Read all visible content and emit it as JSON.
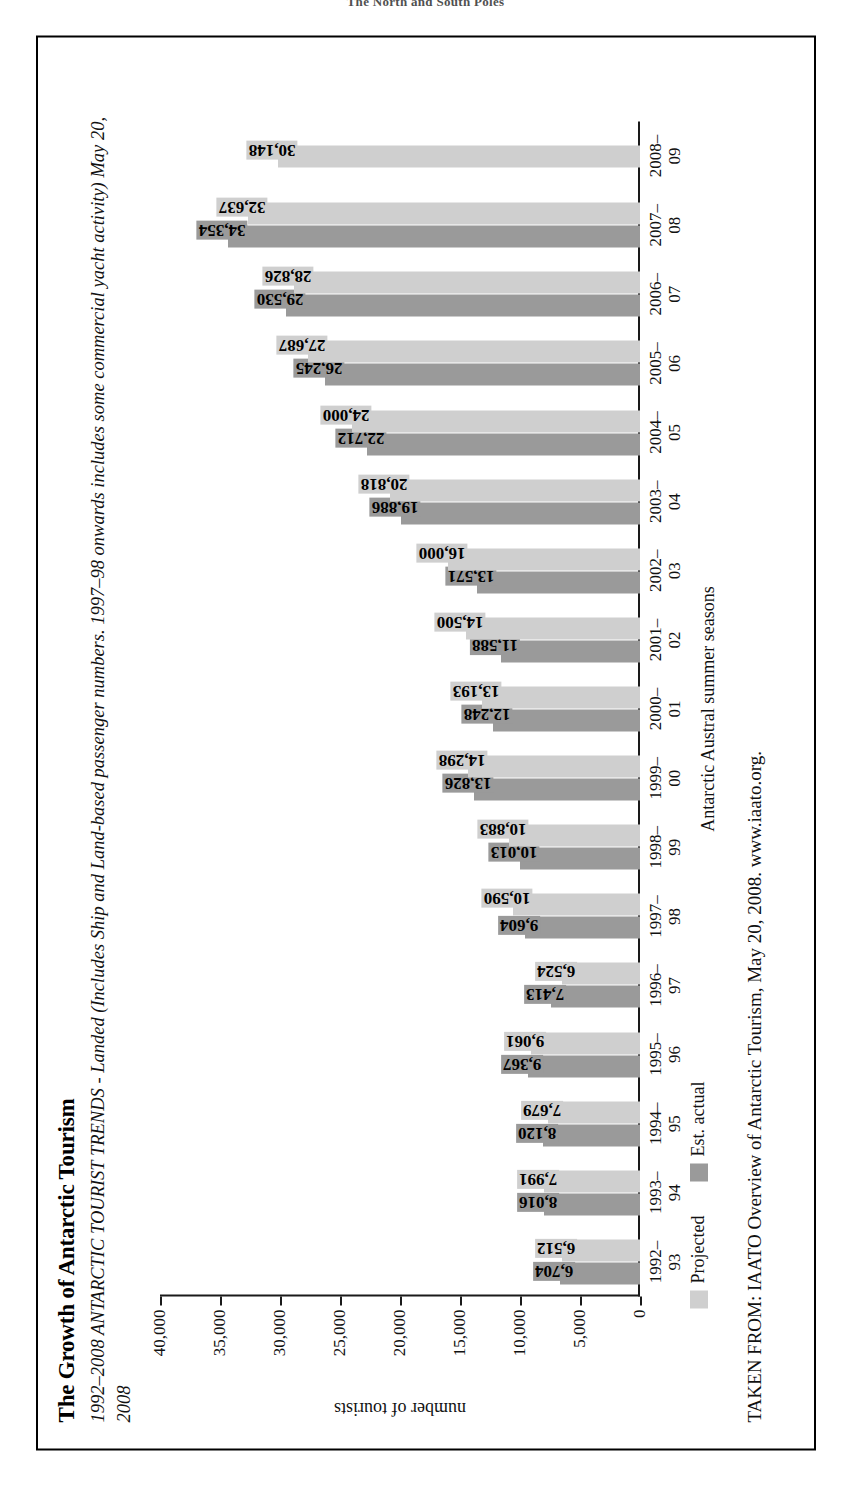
{
  "page_header": "The North and South Poles",
  "figure": {
    "title": "The Growth of Antarctic Tourism",
    "subtitle": "1992–2008 ANTARCTIC TOURIST TRENDS - Landed (Includes Ship and Land-based passenger numbers. 1997–98 onwards includes some commercial yacht activity) May 20, 2008",
    "source": "TAKEN FROM: IAATO Overview of Antarctic Tourism, May 20, 2008. www.iaato.org.",
    "legend": {
      "projected_label": "Projected",
      "actual_label": "Est. actual"
    },
    "colors": {
      "projected": "#cfcfcf",
      "actual": "#9a9a9a",
      "axis": "#1a1a1a",
      "border": "#000000"
    }
  },
  "chart_data": {
    "type": "bar",
    "title": "The Growth of Antarctic Tourism",
    "subtitle": "1992–2008 ANTARCTIC TOURIST TRENDS - Landed (Includes Ship and Land-based passenger numbers. 1997–98 onwards includes some commercial yacht activity) May 20, 2008",
    "xlabel": "Antarctic Austral summer seasons",
    "ylabel": "number of tourists",
    "ylim": [
      0,
      40000
    ],
    "yticks": [
      0,
      5000,
      10000,
      15000,
      20000,
      25000,
      30000,
      35000,
      40000
    ],
    "ytick_labels": [
      "0",
      "5,000",
      "10,000",
      "15,000",
      "20,000",
      "25,000",
      "30,000",
      "35,000",
      "40,000"
    ],
    "grid": false,
    "legend_position": "bottom-left",
    "orientation": "vertical-bars-on-rotated-page",
    "categories": [
      "1992–93",
      "1993–94",
      "1994–95",
      "1995–96",
      "1996–97",
      "1997–98",
      "1998–99",
      "1999–00",
      "2000–01",
      "2001–02",
      "2002–03",
      "2003–04",
      "2004–05",
      "2005–06",
      "2006–07",
      "2007–08",
      "2008–09"
    ],
    "category_lines": [
      [
        "1992–",
        "93"
      ],
      [
        "1993–",
        "94"
      ],
      [
        "1994–",
        "95"
      ],
      [
        "1995–",
        "96"
      ],
      [
        "1996–",
        "97"
      ],
      [
        "1997–",
        "98"
      ],
      [
        "1998–",
        "99"
      ],
      [
        "1999–",
        "00"
      ],
      [
        "2000–",
        "01"
      ],
      [
        "2001–",
        "02"
      ],
      [
        "2002–",
        "03"
      ],
      [
        "2003–",
        "04"
      ],
      [
        "2004–",
        "05"
      ],
      [
        "2005–",
        "06"
      ],
      [
        "2006–",
        "07"
      ],
      [
        "2007–",
        "08"
      ],
      [
        "2008–",
        "09"
      ]
    ],
    "series": [
      {
        "name": "Est. actual",
        "color": "#9a9a9a",
        "values": [
          6704,
          8016,
          8120,
          9367,
          7413,
          9604,
          10013,
          13826,
          12248,
          11588,
          13571,
          19886,
          22712,
          26245,
          29530,
          34354,
          null
        ],
        "labels": [
          "6,704",
          "8,016",
          "8,120",
          "9,367",
          "7,413",
          "9,604",
          "10,013",
          "13,826",
          "12,248",
          "11,588",
          "13,571",
          "19,886",
          "22,712",
          "26,245",
          "29,530",
          "34,354",
          ""
        ]
      },
      {
        "name": "Projected",
        "color": "#cfcfcf",
        "values": [
          6512,
          7991,
          7679,
          9061,
          6524,
          10590,
          10883,
          14298,
          13193,
          14500,
          16000,
          20818,
          24000,
          27687,
          28826,
          32637,
          30148
        ],
        "labels": [
          "6,512",
          "7,991",
          "7,679",
          "9,061",
          "6,524",
          "10,590",
          "10,883",
          "14,298",
          "13,193",
          "14,500",
          "16,000",
          "20,818",
          "24,000",
          "27,687",
          "28,826",
          "32,637",
          "30,148"
        ]
      }
    ]
  }
}
